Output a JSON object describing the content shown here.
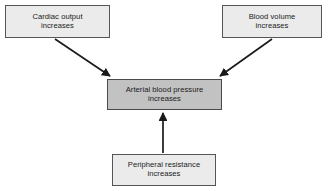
{
  "diagram": {
    "type": "flow-diagram",
    "background_color": "#ffffff",
    "node_fill_plain": "#ebebeb",
    "node_fill_highlight": "#c2c2c2",
    "node_border_color": "#55565a",
    "arrow_color": "#1a1a1a",
    "nodes": [
      {
        "id": "cardiac-output",
        "label": "Cardiac output\nincreases",
        "style": "plain"
      },
      {
        "id": "blood-volume",
        "label": "Blood volume\nincreases",
        "style": "plain"
      },
      {
        "id": "arterial-bp",
        "label": "Arterial blood pressure\nincreases",
        "style": "highlight"
      },
      {
        "id": "peripheral-resistance",
        "label": "Peripheral resistance\nincreases",
        "style": "plain"
      }
    ],
    "edges": [
      {
        "id": "edge-cardiac-to-bp",
        "from": "cardiac-output",
        "to": "arterial-bp",
        "direction": "down-right"
      },
      {
        "id": "edge-volume-to-bp",
        "from": "blood-volume",
        "to": "arterial-bp",
        "direction": "down-left"
      },
      {
        "id": "edge-resistance-to-bp",
        "from": "peripheral-resistance",
        "to": "arterial-bp",
        "direction": "up"
      }
    ]
  }
}
